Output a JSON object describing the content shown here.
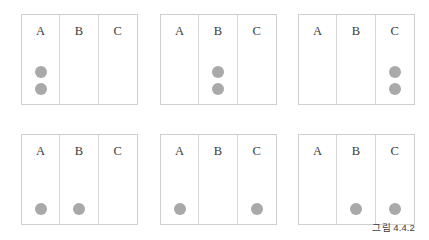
{
  "figure": {
    "caption": "그림 4.4.2",
    "column_labels": [
      "A",
      "B",
      "C"
    ],
    "colors": {
      "dot": "#a9a9a9",
      "box_border": "#cfcfcf",
      "divider": "#d6d6d6",
      "label_text": "#3a3a3a",
      "background": "#ffffff"
    },
    "boxes": [
      {
        "id": "box-1",
        "row": 0,
        "col": 0,
        "columns": [
          {
            "label": "A",
            "dots": 2
          },
          {
            "label": "B",
            "dots": 0
          },
          {
            "label": "C",
            "dots": 0
          }
        ]
      },
      {
        "id": "box-2",
        "row": 0,
        "col": 1,
        "columns": [
          {
            "label": "A",
            "dots": 0
          },
          {
            "label": "B",
            "dots": 2
          },
          {
            "label": "C",
            "dots": 0
          }
        ]
      },
      {
        "id": "box-3",
        "row": 0,
        "col": 2,
        "columns": [
          {
            "label": "A",
            "dots": 0
          },
          {
            "label": "B",
            "dots": 0
          },
          {
            "label": "C",
            "dots": 2
          }
        ]
      },
      {
        "id": "box-4",
        "row": 1,
        "col": 0,
        "columns": [
          {
            "label": "A",
            "dots": 1
          },
          {
            "label": "B",
            "dots": 1
          },
          {
            "label": "C",
            "dots": 0
          }
        ]
      },
      {
        "id": "box-5",
        "row": 1,
        "col": 1,
        "columns": [
          {
            "label": "A",
            "dots": 1
          },
          {
            "label": "B",
            "dots": 0
          },
          {
            "label": "C",
            "dots": 1
          }
        ]
      },
      {
        "id": "box-6",
        "row": 1,
        "col": 2,
        "columns": [
          {
            "label": "A",
            "dots": 0
          },
          {
            "label": "B",
            "dots": 1
          },
          {
            "label": "C",
            "dots": 1
          }
        ]
      }
    ]
  }
}
